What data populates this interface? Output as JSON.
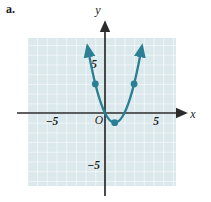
{
  "figure": {
    "part_label": "a.",
    "width": 211,
    "height": 202,
    "background_color": "#ffffff"
  },
  "plot": {
    "grid": {
      "fill_color": "#dce9ec",
      "line_color": "#ffffff",
      "x_min_px": 28,
      "x_max_px": 176,
      "y_min_px": 38,
      "y_max_px": 186,
      "cell_px": 9.7,
      "visible": true
    },
    "axes": {
      "color": "#2b2b2b",
      "x_axis_label": "x",
      "y_axis_label": "y",
      "origin_label": "O",
      "x_axis_y_px": 113,
      "y_axis_x_px": 105,
      "unit_px": 9.7,
      "arrowheads": true
    },
    "ticks": {
      "x": [
        {
          "value": -5,
          "label": "−5"
        },
        {
          "value": 5,
          "label": "5"
        }
      ],
      "y": [
        {
          "value": 5,
          "label": "5"
        },
        {
          "value": -5,
          "label": "−5"
        }
      ]
    }
  },
  "chart_data": {
    "type": "line",
    "title": "",
    "xlabel": "x",
    "ylabel": "y",
    "xlim": [
      -8,
      7.5
    ],
    "ylim": [
      -7.5,
      7.5
    ],
    "grid": true,
    "legend": null,
    "curve_color": "#2b7f95",
    "point_color": "#2b7f95",
    "series": [
      {
        "name": "parabola",
        "kind": "parabola",
        "equation": "y = (x - 1)^2 - 1",
        "vertex": [
          1,
          -1
        ],
        "opens": "up",
        "a": 1,
        "x_domain": [
          -1.8,
          3.8
        ],
        "arrow_start": true,
        "arrow_end": true,
        "x": [
          -1.8,
          -1.4,
          -1.0,
          -0.6,
          -0.2,
          0.2,
          0.6,
          1.0,
          1.4,
          1.8,
          2.2,
          2.6,
          3.0,
          3.4,
          3.8
        ],
        "y": [
          6.84,
          4.76,
          3.0,
          1.56,
          0.44,
          -0.36,
          -0.84,
          -1.0,
          -0.84,
          -0.36,
          0.44,
          1.56,
          3.0,
          4.76,
          6.84
        ]
      }
    ],
    "marked_points": [
      {
        "x": -1.0,
        "y": 3.0
      },
      {
        "x": 1.0,
        "y": -1.0
      },
      {
        "x": 3.0,
        "y": 3.0
      }
    ]
  }
}
